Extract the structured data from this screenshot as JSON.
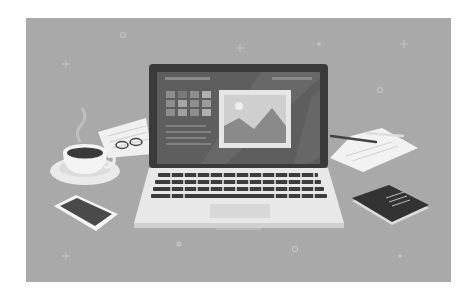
{
  "illustration": {
    "subject": "laptop on desk with coffee, phone, notepads",
    "palette": {
      "background": "#a9a9a9",
      "laptop_bezel": "#3a3a3a",
      "screen": "#5e5e5e",
      "keyboard_deck": "#e8e8e8",
      "keys": "#3c3c3c",
      "paper": "#f2f2f2",
      "coffee": "#3a3a3a",
      "notebook": "#333333"
    },
    "screen_ui": {
      "tile_grid": {
        "rows": 3,
        "cols": 4
      },
      "text_lines": 4,
      "image_placeholder": "mountain-photo"
    },
    "objects": [
      "laptop",
      "coffee-cup",
      "saucer",
      "smartphone",
      "notepad-left",
      "glasses",
      "paper-sheet-right",
      "pen",
      "spiral-notebook"
    ]
  }
}
